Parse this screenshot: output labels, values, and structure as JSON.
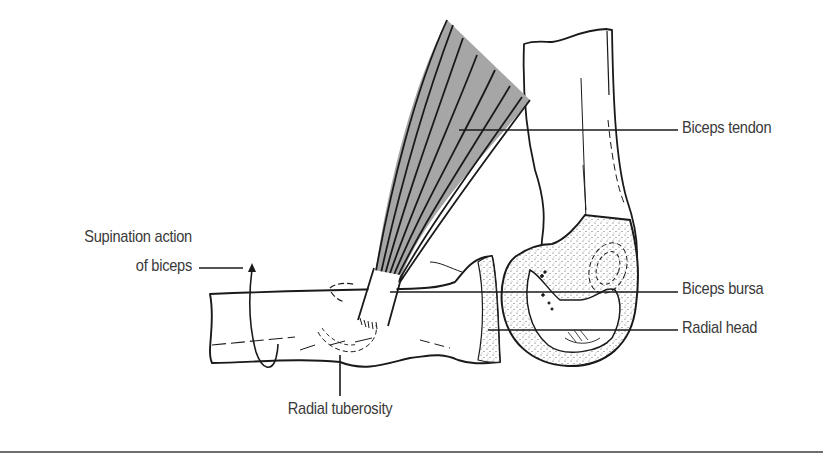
{
  "figure": {
    "colors": {
      "line": "#1a1a1a",
      "muscle_fill": "#a6a6a6",
      "stipple": "#555555",
      "label_text": "#3a3a3a",
      "divider": "#6e6e6e",
      "background": "#ffffff"
    }
  },
  "labels": {
    "biceps_tendon": "Biceps tendon",
    "biceps_bursa": "Biceps bursa",
    "radial_head": "Radial head",
    "supination_line1": "Supination action",
    "supination_line2": "of biceps",
    "radial_tuberosity": "Radial tuberosity"
  },
  "icons": {
    "supination_arrow": "curved-rotation-arrow"
  }
}
